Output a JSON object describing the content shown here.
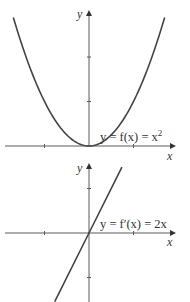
{
  "chart_data": [
    {
      "type": "line",
      "title": "",
      "xlabel": "x",
      "ylabel": "y",
      "annotation": "y = f(x) = x²",
      "annotation_parts": {
        "pre": "y = f(x) = x",
        "sup": "2"
      },
      "function": "x^2",
      "xlim": [
        -2.0,
        2.0
      ],
      "ylim": [
        0,
        2.9
      ],
      "xticks": [
        -1,
        1
      ],
      "yticks": [
        1,
        2
      ],
      "grid": false,
      "series": [
        {
          "name": "f(x) = x^2",
          "x": [
            -1.7,
            -1.5,
            -1.0,
            -0.5,
            0,
            0.5,
            1.0,
            1.5,
            1.7
          ],
          "y": [
            2.89,
            2.25,
            1.0,
            0.25,
            0,
            0.25,
            1.0,
            2.25,
            2.89
          ]
        }
      ]
    },
    {
      "type": "line",
      "title": "",
      "xlabel": "x",
      "ylabel": "y",
      "annotation": "y = f′(x) = 2x",
      "annotation_parts": {
        "pre": "y = f′(x) = 2x",
        "sup": ""
      },
      "function": "2x",
      "xlim": [
        -2.0,
        2.0
      ],
      "ylim": [
        -1.5,
        1.5
      ],
      "xticks": [
        -1,
        1
      ],
      "yticks": [
        1,
        -1
      ],
      "grid": false,
      "series": [
        {
          "name": "f'(x) = 2x",
          "x": [
            -0.77,
            0,
            0.74
          ],
          "y": [
            -1.54,
            0,
            1.48
          ]
        }
      ]
    }
  ]
}
